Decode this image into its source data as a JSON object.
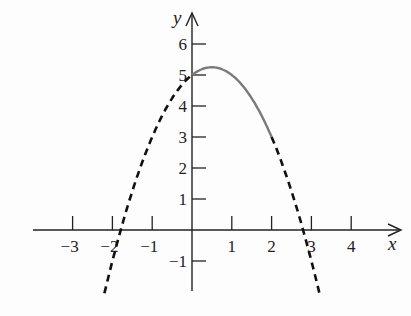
{
  "chart_data": {
    "type": "line",
    "title": "",
    "xlabel": "x",
    "ylabel": "y",
    "xlim": [
      -3.6,
      4.8
    ],
    "ylim": [
      -2.0,
      6.6
    ],
    "grid": false,
    "x_ticks": [
      -3,
      -2,
      -1,
      1,
      2,
      3,
      4
    ],
    "x_tick_labels": [
      "−3",
      "−2",
      "−1",
      "1",
      "2",
      "3",
      "4"
    ],
    "y_ticks": [
      -1,
      1,
      2,
      3,
      4,
      5,
      6
    ],
    "y_tick_labels": [
      "−1",
      "1",
      "2",
      "3",
      "4",
      "5",
      "6"
    ],
    "function": "y = -x^2 + x + 5",
    "series": [
      {
        "name": "solid segment",
        "style": "solid",
        "color": "#7a7a7a",
        "domain": [
          0,
          2
        ],
        "x": [
          0,
          0.5,
          1,
          1.5,
          2
        ],
        "y": [
          5,
          5.25,
          5,
          4.25,
          3
        ]
      },
      {
        "name": "dashed left",
        "style": "dashed",
        "color": "#111111",
        "domain": [
          -2.2,
          0
        ],
        "x": [
          -2.2,
          -1.79,
          -1,
          0
        ],
        "y": [
          -2.04,
          0,
          3,
          5
        ]
      },
      {
        "name": "dashed right",
        "style": "dashed",
        "color": "#111111",
        "domain": [
          2,
          3.2
        ],
        "x": [
          2,
          2.79,
          3,
          3.2
        ],
        "y": [
          3,
          0,
          -1,
          -2.04
        ]
      }
    ],
    "legend": null
  },
  "axes": {
    "x_label": "x",
    "y_label": "y"
  },
  "colors": {
    "solid": "#7a7a7a",
    "dashed": "#111111",
    "axis": "#222222"
  }
}
